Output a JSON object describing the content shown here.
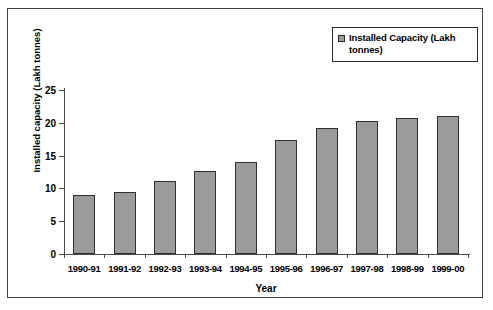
{
  "chart_data": {
    "type": "bar",
    "title": "",
    "xlabel": "Year",
    "ylabel": "Installed capacity (Lakh tonnes)",
    "ylim": [
      0,
      25
    ],
    "yticks": [
      0,
      5,
      10,
      15,
      20,
      25
    ],
    "grid": false,
    "legend_position": "top-right",
    "categories": [
      "1990-91",
      "1991-92",
      "1992-93",
      "1993-94",
      "1994-95",
      "1995-96",
      "1996-97",
      "1997-98",
      "1998-99",
      "1999-00"
    ],
    "series": [
      {
        "name": "Installed Capacity (Lakh tonnes)",
        "color": "#9b9b9b",
        "values": [
          9.0,
          9.5,
          11.1,
          12.6,
          14.0,
          17.4,
          19.2,
          20.3,
          20.8,
          21.0
        ]
      }
    ]
  },
  "legend": {
    "label": "Installed Capacity (Lakh tonnes)",
    "marker": "square-marker"
  },
  "colors": {
    "bar_fill": "#9b9b9b",
    "bar_border": "#2f2f2f",
    "axis": "#4a4a4a",
    "frame": "#3f3f3f",
    "text": "#000000",
    "background": "#ffffff"
  }
}
